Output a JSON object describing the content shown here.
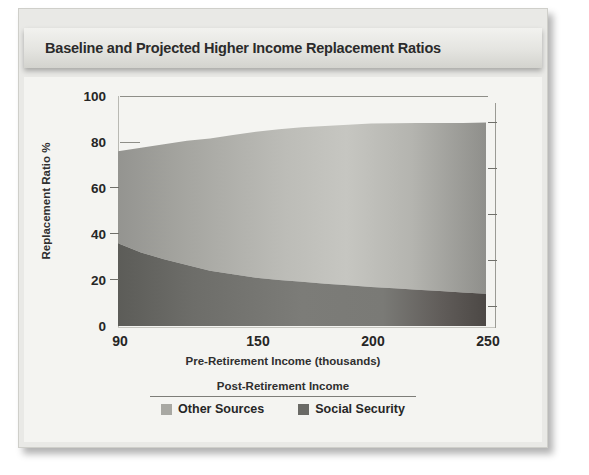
{
  "figure": {
    "title": "Baseline and Projected Higher Income Replacement Ratios"
  },
  "axes": {
    "y_title": "Replacement Ratio %",
    "x_title": "Pre-Retirement Income (thousands)",
    "y_ticks": [
      "0",
      "20",
      "40",
      "60",
      "80",
      "100"
    ],
    "x_ticks": [
      "90",
      "150",
      "200",
      "250"
    ]
  },
  "legend": {
    "title": "Post-Retirement Income",
    "items": [
      {
        "label": "Other Sources",
        "color": "#a8a8a3"
      },
      {
        "label": "Social Security",
        "color": "#6a6a66"
      }
    ]
  },
  "colors": {
    "other_sources": "#a8a8a3",
    "social_security": "#6a6a66",
    "panel": "#e9e9e6",
    "plot_background": "#f4f4f1",
    "axis": "#6f6f6a",
    "text": "#262626"
  },
  "chart_data": {
    "type": "area",
    "title": "Baseline and Projected Higher Income Replacement Ratios",
    "xlabel": "Pre-Retirement Income (thousands)",
    "ylabel": "Replacement Ratio %",
    "xlim": [
      90,
      250
    ],
    "ylim": [
      0,
      100
    ],
    "xticks": [
      90,
      150,
      200,
      250
    ],
    "yticks": [
      0,
      20,
      40,
      60,
      80,
      100
    ],
    "grid": false,
    "stacked": true,
    "legend_position": "bottom",
    "x": [
      90,
      100,
      110,
      120,
      130,
      140,
      150,
      160,
      170,
      180,
      190,
      200,
      210,
      220,
      230,
      240,
      250
    ],
    "series": [
      {
        "name": "Social Security",
        "values": [
          36,
          32,
          29,
          26.5,
          24,
          22.5,
          21,
          20,
          19.2,
          18.4,
          17.7,
          17,
          16.4,
          15.8,
          15.2,
          14.6,
          14
        ]
      },
      {
        "name": "Other Sources",
        "values": [
          40,
          45.5,
          50,
          54,
          57.5,
          60.5,
          63.5,
          65.5,
          67.2,
          68.6,
          69.8,
          71,
          71.8,
          72.5,
          73.1,
          73.7,
          74.5
        ]
      }
    ],
    "totals": [
      76,
      77.5,
      79,
      80.5,
      81.5,
      83,
      84.5,
      85.5,
      86.4,
      87,
      87.5,
      88,
      88.2,
      88.3,
      88.3,
      88.3,
      88.5
    ]
  }
}
